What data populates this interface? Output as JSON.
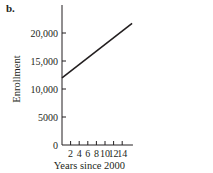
{
  "panel_label": "b.",
  "chart_data": {
    "type": "line",
    "title": "",
    "xlabel": "Years since 2000",
    "ylabel": "Enrollment",
    "xlim": [
      0,
      16.5
    ],
    "ylim": [
      0,
      25000
    ],
    "xticks": [
      2,
      4,
      6,
      8,
      10,
      12,
      14
    ],
    "xtick_labels": [
      "2",
      "4",
      "6",
      "8",
      "10",
      "12",
      "14"
    ],
    "yticks": [
      0,
      5000,
      10000,
      15000,
      20000
    ],
    "ytick_labels": [
      "0",
      "5000",
      "10,000",
      "15,000",
      "20,000"
    ],
    "grid": false,
    "legend": null,
    "series": [
      {
        "name": "Enrollment",
        "x": [
          0,
          16.3
        ],
        "y": [
          12000,
          21700
        ],
        "color": "#231f20"
      }
    ]
  }
}
